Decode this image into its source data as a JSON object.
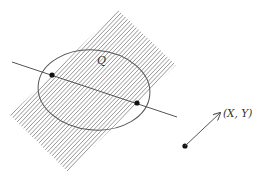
{
  "diagram": {
    "colors": {
      "background": "#ffffff",
      "hatch": "#8a8a8a",
      "ellipse": "#555555",
      "line": "#555555",
      "point": "#111111",
      "arrow": "#555555",
      "text": "#333333"
    },
    "band": {
      "corners": [
        [
          118,
          10
        ],
        [
          176,
          65
        ],
        [
          68,
          172
        ],
        [
          10,
          115
        ]
      ],
      "hatch_direction": "bottom-left to top-right"
    },
    "ellipse": {
      "label": "Q",
      "cx": 94,
      "cy": 90,
      "rx": 56,
      "ry": 40,
      "rotation_deg": 5
    },
    "line": {
      "start": [
        12,
        62
      ],
      "end": [
        177,
        117
      ],
      "intersection_points": [
        [
          52,
          75
        ],
        [
          137,
          103
        ]
      ]
    },
    "arrow": {
      "from": [
        185,
        146
      ],
      "to": [
        220,
        113
      ],
      "label": "(X, Y)"
    }
  }
}
